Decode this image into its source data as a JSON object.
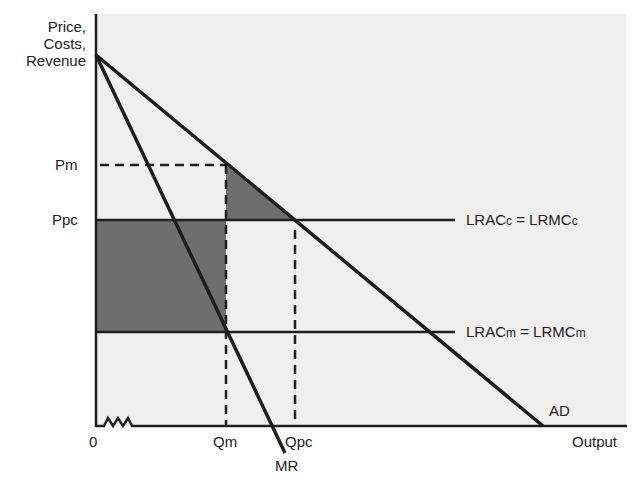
{
  "diagram": {
    "y_axis_label": [
      "Price,",
      "Costs,",
      "Revenue"
    ],
    "x_axis_label": "Output",
    "origin_label": "0",
    "price_labels": {
      "pm": "Pm",
      "ppc": "Ppc"
    },
    "quantity_labels": {
      "qm": "Qm",
      "qpc": "Qpc"
    },
    "curves": {
      "ad": "AD",
      "mr": "MR",
      "lrac_c": {
        "main": "LRAC",
        "sub": "c",
        "eq": " = LRMC",
        "sub2": "c"
      },
      "lrac_m": {
        "main": "LRAC",
        "sub": "m",
        "eq": " = LRMC",
        "sub2": "m"
      }
    },
    "colors": {
      "background_panel": "#efefef",
      "shaded": "#6e6e6e",
      "line": "#1e1e1e"
    }
  }
}
